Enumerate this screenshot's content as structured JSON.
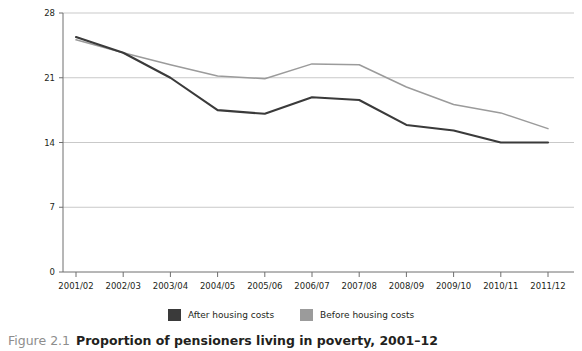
{
  "chart_data": {
    "type": "line",
    "title": "Proportion of pensioners living in poverty, 2001–12",
    "xlabel": "",
    "ylabel": "Proportion in poverty (%)",
    "categories": [
      "2001/02",
      "2002/03",
      "2003/04",
      "2004/05",
      "2005/06",
      "2006/07",
      "2007/08",
      "2008/09",
      "2009/10",
      "2010/11",
      "2011/12"
    ],
    "yticks": [
      0,
      7,
      14,
      21,
      28
    ],
    "ylim": [
      0,
      28
    ],
    "grid": true,
    "legend_position": "bottom",
    "series": [
      {
        "name": "After housing costs",
        "color": "#3a3a3a",
        "values": [
          25.4,
          23.7,
          21.0,
          17.5,
          17.1,
          18.9,
          18.6,
          15.9,
          15.3,
          14.0,
          14.0
        ]
      },
      {
        "name": "Before housing costs",
        "color": "#9b9b9b",
        "values": [
          25.1,
          23.7,
          22.4,
          21.2,
          20.9,
          22.5,
          22.4,
          20.0,
          18.1,
          17.2,
          15.5
        ]
      }
    ]
  },
  "caption": {
    "figure_number": "Figure 2.1",
    "text": "Proportion of pensioners living in poverty, 2001–12"
  },
  "colors": {
    "axis": "#6f6f6f",
    "grid": "#c9c9c9",
    "after_housing": "#3a3a3a",
    "before_housing": "#9b9b9b",
    "caption_figno": "#8d8d8d",
    "text": "#231f20"
  }
}
